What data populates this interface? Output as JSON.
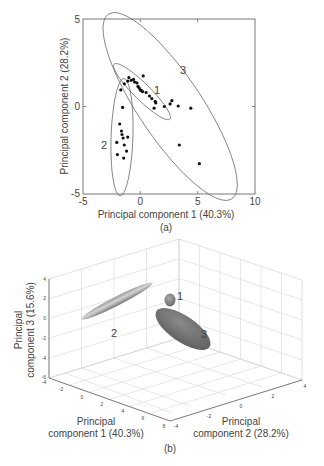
{
  "figure": {
    "caption_a": "(a)",
    "caption_b": "(b)"
  },
  "chart_data": [
    {
      "type": "scatter",
      "title": "",
      "panel": "(a)",
      "xlabel": "Principal component 1 (40.3%)",
      "ylabel": "Principal component 2 (28.2%)",
      "xlim": [
        -5,
        10
      ],
      "ylim": [
        -5,
        5
      ],
      "xticks": [
        "-5",
        "0",
        "5",
        "10"
      ],
      "yticks": [
        "-5",
        "0",
        "5"
      ],
      "grid": false,
      "points": [
        {
          "x": -1.0,
          "y": 1.65
        },
        {
          "x": -1.1,
          "y": 1.45
        },
        {
          "x": -0.8,
          "y": 1.5
        },
        {
          "x": -0.6,
          "y": 1.55
        },
        {
          "x": -0.5,
          "y": 1.4
        },
        {
          "x": -0.3,
          "y": 1.35
        },
        {
          "x": -0.2,
          "y": 1.15
        },
        {
          "x": -0.1,
          "y": 1.05
        },
        {
          "x": 0.0,
          "y": 0.95
        },
        {
          "x": 0.1,
          "y": 0.9
        },
        {
          "x": 0.25,
          "y": 1.75
        },
        {
          "x": 0.2,
          "y": 0.85
        },
        {
          "x": 0.5,
          "y": 0.8
        },
        {
          "x": 0.8,
          "y": 0.6
        },
        {
          "x": 1.0,
          "y": 0.45
        },
        {
          "x": 1.3,
          "y": 0.3
        },
        {
          "x": 1.35,
          "y": 0.2
        },
        {
          "x": 1.2,
          "y": -0.1
        },
        {
          "x": -1.4,
          "y": 1.3
        },
        {
          "x": 2.1,
          "y": 0.0
        },
        {
          "x": 2.6,
          "y": 0.15
        },
        {
          "x": 2.75,
          "y": 0.33
        },
        {
          "x": 3.3,
          "y": 0.03
        },
        {
          "x": 4.4,
          "y": -0.1
        },
        {
          "x": 3.4,
          "y": -2.2
        },
        {
          "x": 5.15,
          "y": -3.27
        },
        {
          "x": -1.7,
          "y": 0.95
        },
        {
          "x": -1.55,
          "y": -0.05
        },
        {
          "x": -1.8,
          "y": -1.0
        },
        {
          "x": -1.65,
          "y": -1.4
        },
        {
          "x": -1.6,
          "y": -1.6
        },
        {
          "x": -1.5,
          "y": -1.8
        },
        {
          "x": -1.1,
          "y": -1.75
        },
        {
          "x": -2.05,
          "y": -2.05
        },
        {
          "x": -1.4,
          "y": -2.2
        },
        {
          "x": -1.2,
          "y": -2.55
        },
        {
          "x": -2.0,
          "y": -2.75
        },
        {
          "x": -1.45,
          "y": -2.95
        }
      ],
      "ellipses": [
        {
          "label": "1",
          "cx": 0.15,
          "cy": 0.85,
          "rx": 2.9,
          "ry": 0.55,
          "angle_deg": -32
        },
        {
          "label": "2",
          "cx": -1.6,
          "cy": -1.75,
          "rx": 0.95,
          "ry": 3.35,
          "angle_deg": -3
        },
        {
          "label": "3",
          "cx": 2.6,
          "cy": 0.0,
          "rx": 7.6,
          "ry": 2.3,
          "angle_deg": -42
        }
      ]
    },
    {
      "type": "3d-ellipsoid",
      "panel": "(b)",
      "xlabel": "Principal component 1 (40.3%)",
      "ylabel": "Principal component 2 (28.2%)",
      "zlabel": "Principal component 3 (15.6%)",
      "xticks": [
        "-4",
        "-2",
        "0",
        "2",
        "4",
        "6",
        "8"
      ],
      "yticks": [
        "-4",
        "-2",
        "0",
        "2",
        "4"
      ],
      "zticks": [
        "-6",
        "-4",
        "-2",
        "0",
        "2",
        "4"
      ],
      "grid": true,
      "ellipsoids": [
        {
          "label": "1",
          "shape": "small sphere-like"
        },
        {
          "label": "2",
          "shape": "long thin elongated"
        },
        {
          "label": "3",
          "shape": "large flattened oblate"
        }
      ]
    }
  ],
  "text": {
    "a_xlabel": "Principal component 1 (40.3%)",
    "a_ylabel": "Principal component 2 (28.2%)",
    "a_xtick_0": "-5",
    "a_xtick_1": "0",
    "a_xtick_2": "5",
    "a_xtick_3": "10",
    "a_ytick_0": "5",
    "a_ytick_1": "0",
    "a_ytick_2": "-5",
    "a_label_1": "1",
    "a_label_2": "2",
    "a_label_3": "3",
    "b_zlabel_l1": "Principal",
    "b_zlabel_l2": "component 3 (15.6%)",
    "b_xlabel_l1": "Principal",
    "b_xlabel_l2": "component 1 (40.3%)",
    "b_ylabel_l1": "Principal",
    "b_ylabel_l2": "component 2 (28.2%)",
    "b_label_1": "1",
    "b_label_2": "2",
    "b_label_3": "3",
    "b_zt": [
      "4",
      "2",
      "0",
      "-2",
      "-4",
      "-6"
    ],
    "b_xt": [
      "-4",
      "-2",
      "0",
      "2",
      "4",
      "6",
      "8"
    ],
    "b_yt": [
      "-4",
      "-2",
      "0",
      "2",
      "4"
    ]
  }
}
